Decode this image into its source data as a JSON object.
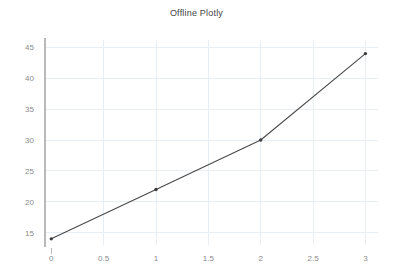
{
  "chart_data": {
    "type": "line",
    "title": "Offline Plotly",
    "xlabel": "",
    "ylabel": "",
    "x": [
      0,
      1,
      2,
      3
    ],
    "values": [
      14,
      22,
      30,
      44
    ],
    "series": [
      {
        "name": "trace 0",
        "x": [
          0,
          1,
          2,
          3
        ],
        "values": [
          14,
          22,
          30,
          44
        ]
      }
    ],
    "xlim": [
      -0.06,
      3.12
    ],
    "ylim": [
      13.0,
      46.2
    ],
    "xticks": [
      0,
      0.5,
      1,
      1.5,
      2,
      2.5,
      3
    ],
    "xtick_labels": [
      "0",
      "0.5",
      "1",
      "1.5",
      "2",
      "2.5",
      "3"
    ],
    "yticks": [
      15,
      20,
      25,
      30,
      35,
      40,
      45
    ],
    "ytick_labels": [
      "15",
      "20",
      "25",
      "30",
      "35",
      "40",
      "45"
    ],
    "grid": true,
    "legend": false,
    "legend_position": "none",
    "markers": true,
    "line_color": "#4a4a4a",
    "marker_color": "#3c3c3c",
    "grid_color": "#e9eef2",
    "axis_color": "#b9b9b9",
    "background_color": "#ffffff",
    "title_color": "#444444",
    "tick_color": "#8a8a8a"
  }
}
